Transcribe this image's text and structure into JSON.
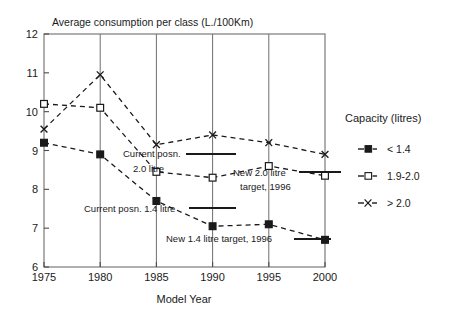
{
  "chart_data": {
    "type": "line",
    "title": "Average consumption per class (L./100Km)",
    "xlabel": "Model Year",
    "ylabel": "",
    "categories": [
      "1975",
      "1980",
      "1985",
      "1990",
      "1995",
      "2000"
    ],
    "x": [
      1975,
      1980,
      1985,
      1990,
      1995,
      2000
    ],
    "xlim": [
      1975,
      2000
    ],
    "ylim": [
      6,
      12
    ],
    "yticks": [
      "6",
      "7",
      "8",
      "9",
      "10",
      "11",
      "12"
    ],
    "grid": "vertical-only",
    "legend_position": "right",
    "line_style": "dashed",
    "series": [
      {
        "name": "< 1.4",
        "marker": "filled-square",
        "values": [
          9.2,
          8.9,
          7.7,
          7.05,
          7.1,
          6.7
        ]
      },
      {
        "name": "1.9-2.0",
        "marker": "open-square",
        "values": [
          10.2,
          10.1,
          8.45,
          8.3,
          8.6,
          8.35
        ]
      },
      {
        "name": "> 2.0",
        "marker": "x-cross",
        "values": [
          9.55,
          10.95,
          9.15,
          9.4,
          9.2,
          8.9
        ]
      }
    ],
    "annotations": [
      {
        "id": "current-posn-2-0-litre",
        "line1": "Current posn.",
        "line2": "2.0 litre",
        "marker_value": 8.9
      },
      {
        "id": "new-2-0-litre-target",
        "line1": "New 2.0 litre",
        "line2": "target, 1996",
        "marker_value": 8.35
      },
      {
        "id": "current-posn-1-4-litre",
        "line1": "Current posn. 1.4 litre",
        "line2": "",
        "marker_value": 7.4
      },
      {
        "id": "new-1-4-litre-target",
        "line1": "New 1.4 litre target, 1996",
        "line2": "",
        "marker_value": 6.85
      }
    ]
  },
  "legend": {
    "title": "Capacity (litres)",
    "items": [
      {
        "label": "< 1.4"
      },
      {
        "label": "1.9-2.0"
      },
      {
        "label": "> 2.0"
      }
    ]
  },
  "colors": {
    "ink": "#1a1a1a",
    "grid": "#6e6e6e",
    "axis": "#4a4a4a",
    "background": "#ffffff"
  }
}
